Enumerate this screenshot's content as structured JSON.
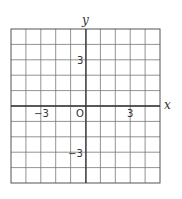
{
  "grid": {
    "columns": 10,
    "rows": 10,
    "x_range": [
      -5,
      5
    ],
    "y_range": [
      -5,
      5
    ],
    "line_color": "#666666",
    "axis_color": "#444444"
  },
  "axes": {
    "x_label": "x",
    "y_label": "y"
  },
  "tick_labels": {
    "x_neg": "−3",
    "origin": "O",
    "x_pos": "3",
    "y_pos": "3",
    "y_neg": "−3"
  }
}
